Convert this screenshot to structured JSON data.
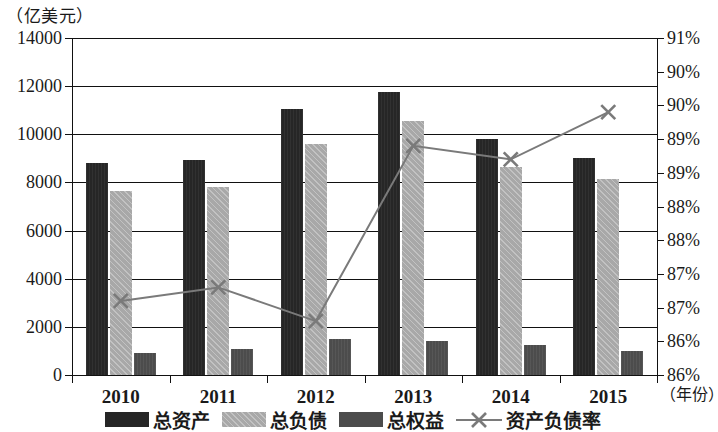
{
  "chart_data": {
    "type": "bar",
    "title": "",
    "unit_caption": "（亿美元）",
    "xlabel": "（年份）",
    "ylabel": "",
    "categories": [
      "2010",
      "2011",
      "2012",
      "2013",
      "2014",
      "2015"
    ],
    "series": [
      {
        "name": "总资产",
        "type": "bar",
        "axis": "left",
        "values": [
          8800,
          8950,
          11050,
          11750,
          9800,
          9000
        ]
      },
      {
        "name": "总负债",
        "type": "bar",
        "axis": "left",
        "values": [
          7650,
          7800,
          9600,
          10550,
          8650,
          8150
        ]
      },
      {
        "name": "总权益",
        "type": "bar",
        "axis": "left",
        "values": [
          900,
          1100,
          1500,
          1400,
          1250,
          1000
        ]
      },
      {
        "name": "资产负债率",
        "type": "line",
        "axis": "right",
        "values": [
          87.1,
          87.3,
          86.8,
          89.4,
          89.2,
          89.9
        ]
      }
    ],
    "left_axis": {
      "min": 0,
      "max": 14000,
      "step": 2000,
      "ticks": [
        "0",
        "2000",
        "4000",
        "6000",
        "8000",
        "10000",
        "12000",
        "14000"
      ]
    },
    "right_axis": {
      "min": 86.0,
      "max": 91.0,
      "step": 0.5,
      "ticks": [
        "86%",
        "86%",
        "87%",
        "87%",
        "88%",
        "88%",
        "89%",
        "89%",
        "90%",
        "90%",
        "91%"
      ]
    },
    "grid": true,
    "legend_position": "bottom",
    "colors": {
      "assets": "#262626",
      "liabilities": "#a8a8a8",
      "equity": "#4c4c4c",
      "ratio_line": "#7a7a7a"
    }
  },
  "legend": {
    "items": [
      {
        "label": "总资产",
        "icon": "filled-square-dark"
      },
      {
        "label": "总负债",
        "icon": "filled-square-light"
      },
      {
        "label": "总权益",
        "icon": "filled-square-mid"
      },
      {
        "label": "资产负债率",
        "icon": "line-x-marker"
      }
    ]
  }
}
